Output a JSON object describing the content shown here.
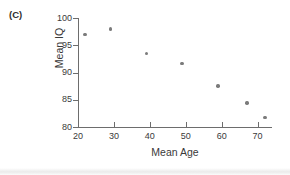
{
  "panel": {
    "label": "(C)"
  },
  "chart_data": {
    "type": "scatter",
    "title": "",
    "xlabel": "Mean Age",
    "ylabel": "Mean IQ",
    "xlim": [
      20,
      74
    ],
    "ylim": [
      80,
      100
    ],
    "xticks": [
      20,
      30,
      40,
      50,
      60,
      70
    ],
    "yticks": [
      80,
      85,
      90,
      95,
      100
    ],
    "xtick_labels": [
      "20",
      "30",
      "40",
      "50",
      "60",
      "70"
    ],
    "ytick_labels": [
      "80",
      "85",
      "90",
      "95",
      "100"
    ],
    "grid": false,
    "legend": null,
    "marker_color": "#7b7b7b",
    "axis_color": "#6d6d6d",
    "points": [
      {
        "x": 22,
        "y": 97.0
      },
      {
        "x": 29,
        "y": 98.0
      },
      {
        "x": 39,
        "y": 93.5
      },
      {
        "x": 49,
        "y": 91.7
      },
      {
        "x": 59,
        "y": 87.5
      },
      {
        "x": 67,
        "y": 84.4
      },
      {
        "x": 72,
        "y": 81.7
      }
    ]
  }
}
